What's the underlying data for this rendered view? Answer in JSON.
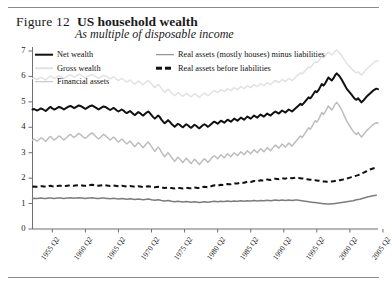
{
  "figure": {
    "label": "Figure 12",
    "title": "US household wealth",
    "subtitle": "As multiple of disposable income"
  },
  "chart_data": {
    "type": "line",
    "title": "US household wealth",
    "subtitle": "As multiple of disposable income",
    "xlabel": "",
    "ylabel": "",
    "ylim": [
      0,
      7
    ],
    "yticks": [
      0,
      1,
      2,
      3,
      4,
      5,
      6,
      7
    ],
    "grid": false,
    "legend_position": "top-inside",
    "xtick_labels": [
      "1955 Q2",
      "1960 Q2",
      "1965 Q2",
      "1970 Q2",
      "1975 Q2",
      "1980 Q2",
      "1985 Q2",
      "1990 Q2",
      "1995 Q2",
      "2000 Q2",
      "2005 Q2"
    ],
    "x_start": "1952 Q2",
    "x_end": "2006 Q2",
    "x_step_quarters": 1,
    "series": [
      {
        "name": "Net wealth",
        "color": "#111111",
        "width": 2.0,
        "dash": "solid",
        "values": [
          4.7,
          4.72,
          4.68,
          4.66,
          4.7,
          4.74,
          4.72,
          4.68,
          4.64,
          4.7,
          4.76,
          4.8,
          4.74,
          4.7,
          4.72,
          4.76,
          4.8,
          4.78,
          4.74,
          4.7,
          4.74,
          4.78,
          4.82,
          4.84,
          4.8,
          4.76,
          4.78,
          4.82,
          4.86,
          4.84,
          4.8,
          4.76,
          4.72,
          4.76,
          4.8,
          4.84,
          4.86,
          4.82,
          4.78,
          4.74,
          4.7,
          4.74,
          4.78,
          4.82,
          4.8,
          4.76,
          4.72,
          4.68,
          4.72,
          4.76,
          4.72,
          4.66,
          4.62,
          4.66,
          4.7,
          4.66,
          4.6,
          4.56,
          4.6,
          4.64,
          4.58,
          4.52,
          4.48,
          4.54,
          4.6,
          4.56,
          4.5,
          4.46,
          4.52,
          4.58,
          4.62,
          4.56,
          4.48,
          4.4,
          4.34,
          4.4,
          4.46,
          4.4,
          4.3,
          4.22,
          4.16,
          4.22,
          4.28,
          4.22,
          4.14,
          4.08,
          4.02,
          4.08,
          4.14,
          4.1,
          4.04,
          4.0,
          4.06,
          4.12,
          4.08,
          4.02,
          3.98,
          4.04,
          4.1,
          4.06,
          4.0,
          3.96,
          4.02,
          4.08,
          4.12,
          4.08,
          4.02,
          4.06,
          4.12,
          4.18,
          4.22,
          4.18,
          4.14,
          4.2,
          4.26,
          4.22,
          4.18,
          4.24,
          4.3,
          4.26,
          4.22,
          4.28,
          4.34,
          4.3,
          4.26,
          4.32,
          4.38,
          4.34,
          4.3,
          4.36,
          4.42,
          4.38,
          4.34,
          4.4,
          4.46,
          4.42,
          4.38,
          4.44,
          4.5,
          4.46,
          4.42,
          4.48,
          4.54,
          4.5,
          4.46,
          4.52,
          4.58,
          4.62,
          4.58,
          4.54,
          4.6,
          4.66,
          4.62,
          4.58,
          4.64,
          4.7,
          4.66,
          4.62,
          4.68,
          4.74,
          4.8,
          4.86,
          4.92,
          4.88,
          4.94,
          5.02,
          5.1,
          5.18,
          5.14,
          5.22,
          5.32,
          5.42,
          5.38,
          5.46,
          5.58,
          5.7,
          5.64,
          5.72,
          5.84,
          5.96,
          5.9,
          5.84,
          5.92,
          6.04,
          6.12,
          6.06,
          5.98,
          5.88,
          5.76,
          5.64,
          5.52,
          5.44,
          5.36,
          5.28,
          5.2,
          5.12,
          5.08,
          5.14,
          5.06,
          4.98,
          5.04,
          5.12,
          5.2,
          5.26,
          5.32,
          5.38,
          5.44,
          5.48,
          5.52,
          5.5
        ]
      },
      {
        "name": "Gross wealth",
        "color": "#e2e2e2",
        "width": 1.5,
        "dash": "solid",
        "values": [
          5.92,
          5.94,
          5.9,
          5.88,
          5.92,
          5.96,
          5.94,
          5.9,
          5.86,
          5.92,
          5.98,
          6.02,
          5.96,
          5.92,
          5.94,
          5.98,
          6.02,
          6.0,
          5.96,
          5.92,
          5.96,
          6.0,
          6.04,
          6.06,
          6.02,
          5.98,
          6.0,
          6.04,
          6.08,
          6.06,
          6.02,
          5.98,
          5.94,
          5.98,
          6.02,
          6.06,
          6.08,
          6.04,
          6.0,
          5.96,
          5.92,
          5.96,
          6.0,
          6.04,
          6.02,
          5.98,
          5.94,
          5.9,
          5.94,
          5.98,
          5.94,
          5.88,
          5.84,
          5.88,
          5.92,
          5.88,
          5.82,
          5.78,
          5.82,
          5.86,
          5.8,
          5.74,
          5.7,
          5.76,
          5.82,
          5.78,
          5.72,
          5.68,
          5.74,
          5.8,
          5.84,
          5.78,
          5.7,
          5.62,
          5.56,
          5.62,
          5.68,
          5.62,
          5.52,
          5.44,
          5.38,
          5.44,
          5.5,
          5.44,
          5.36,
          5.3,
          5.24,
          5.3,
          5.36,
          5.32,
          5.26,
          5.22,
          5.28,
          5.34,
          5.3,
          5.24,
          5.2,
          5.26,
          5.32,
          5.28,
          5.22,
          5.18,
          5.24,
          5.3,
          5.34,
          5.3,
          5.24,
          5.28,
          5.34,
          5.4,
          5.44,
          5.4,
          5.36,
          5.42,
          5.48,
          5.44,
          5.4,
          5.46,
          5.52,
          5.48,
          5.44,
          5.5,
          5.56,
          5.52,
          5.48,
          5.54,
          5.6,
          5.56,
          5.52,
          5.58,
          5.64,
          5.6,
          5.56,
          5.62,
          5.68,
          5.64,
          5.6,
          5.66,
          5.72,
          5.68,
          5.64,
          5.7,
          5.76,
          5.72,
          5.68,
          5.74,
          5.8,
          5.84,
          5.8,
          5.76,
          5.82,
          5.88,
          5.84,
          5.8,
          5.86,
          5.92,
          5.88,
          5.84,
          5.9,
          5.96,
          6.02,
          6.08,
          6.14,
          6.1,
          6.16,
          6.22,
          6.3,
          6.38,
          6.34,
          6.42,
          6.5,
          6.58,
          6.54,
          6.6,
          6.7,
          6.8,
          6.74,
          6.8,
          6.88,
          6.96,
          6.9,
          6.84,
          6.9,
          6.98,
          7.04,
          6.98,
          6.9,
          6.82,
          6.72,
          6.62,
          6.52,
          6.44,
          6.38,
          6.3,
          6.24,
          6.18,
          6.14,
          6.18,
          6.12,
          6.06,
          6.12,
          6.2,
          6.28,
          6.34,
          6.4,
          6.46,
          6.52,
          6.58,
          6.62,
          6.6
        ]
      },
      {
        "name": "Financial assets",
        "color": "#bdbdbd",
        "width": 1.5,
        "dash": "solid",
        "values": [
          3.5,
          3.54,
          3.48,
          3.46,
          3.52,
          3.58,
          3.56,
          3.5,
          3.44,
          3.52,
          3.6,
          3.64,
          3.56,
          3.5,
          3.54,
          3.6,
          3.66,
          3.62,
          3.56,
          3.5,
          3.56,
          3.62,
          3.68,
          3.72,
          3.66,
          3.6,
          3.64,
          3.7,
          3.76,
          3.72,
          3.66,
          3.6,
          3.56,
          3.62,
          3.68,
          3.74,
          3.78,
          3.72,
          3.66,
          3.6,
          3.54,
          3.6,
          3.66,
          3.72,
          3.68,
          3.62,
          3.56,
          3.5,
          3.56,
          3.62,
          3.56,
          3.48,
          3.42,
          3.48,
          3.54,
          3.48,
          3.4,
          3.34,
          3.4,
          3.46,
          3.38,
          3.3,
          3.24,
          3.32,
          3.4,
          3.34,
          3.26,
          3.2,
          3.28,
          3.36,
          3.42,
          3.34,
          3.24,
          3.14,
          3.06,
          3.14,
          3.22,
          3.14,
          3.02,
          2.92,
          2.84,
          2.92,
          3.0,
          2.92,
          2.82,
          2.74,
          2.66,
          2.74,
          2.82,
          2.76,
          2.68,
          2.62,
          2.7,
          2.78,
          2.72,
          2.64,
          2.58,
          2.66,
          2.74,
          2.68,
          2.6,
          2.54,
          2.62,
          2.7,
          2.76,
          2.7,
          2.62,
          2.68,
          2.76,
          2.84,
          2.88,
          2.82,
          2.76,
          2.84,
          2.92,
          2.86,
          2.8,
          2.88,
          2.96,
          2.9,
          2.84,
          2.92,
          3.0,
          2.94,
          2.88,
          2.96,
          3.04,
          2.98,
          2.92,
          3.0,
          3.08,
          3.02,
          2.96,
          3.04,
          3.12,
          3.06,
          3.0,
          3.08,
          3.16,
          3.1,
          3.04,
          3.12,
          3.2,
          3.14,
          3.08,
          3.16,
          3.24,
          3.3,
          3.24,
          3.18,
          3.26,
          3.34,
          3.28,
          3.22,
          3.3,
          3.38,
          3.32,
          3.26,
          3.34,
          3.42,
          3.5,
          3.58,
          3.66,
          3.6,
          3.68,
          3.78,
          3.88,
          3.98,
          3.92,
          4.02,
          4.14,
          4.26,
          4.2,
          4.3,
          4.44,
          4.58,
          4.5,
          4.6,
          4.72,
          4.84,
          4.76,
          4.68,
          4.78,
          4.9,
          4.98,
          4.9,
          4.8,
          4.68,
          4.54,
          4.4,
          4.26,
          4.14,
          4.04,
          3.94,
          3.84,
          3.76,
          3.72,
          3.8,
          3.7,
          3.62,
          3.7,
          3.78,
          3.86,
          3.92,
          3.98,
          4.04,
          4.1,
          4.14,
          4.18,
          4.16
        ]
      },
      {
        "name": "Real assets (mostly houses) minus liabilities",
        "color": "#7d7d7d",
        "width": 1.5,
        "dash": "solid",
        "values": [
          1.2,
          1.21,
          1.2,
          1.2,
          1.21,
          1.22,
          1.21,
          1.2,
          1.2,
          1.21,
          1.22,
          1.22,
          1.21,
          1.2,
          1.21,
          1.22,
          1.22,
          1.22,
          1.21,
          1.2,
          1.21,
          1.22,
          1.22,
          1.23,
          1.22,
          1.21,
          1.22,
          1.22,
          1.23,
          1.22,
          1.22,
          1.21,
          1.2,
          1.21,
          1.22,
          1.22,
          1.23,
          1.22,
          1.21,
          1.2,
          1.2,
          1.21,
          1.22,
          1.22,
          1.21,
          1.2,
          1.2,
          1.19,
          1.2,
          1.21,
          1.2,
          1.19,
          1.18,
          1.19,
          1.2,
          1.19,
          1.18,
          1.17,
          1.18,
          1.19,
          1.18,
          1.17,
          1.16,
          1.17,
          1.18,
          1.17,
          1.16,
          1.15,
          1.16,
          1.17,
          1.18,
          1.17,
          1.15,
          1.14,
          1.13,
          1.14,
          1.15,
          1.14,
          1.12,
          1.11,
          1.1,
          1.11,
          1.12,
          1.11,
          1.09,
          1.08,
          1.07,
          1.08,
          1.09,
          1.08,
          1.07,
          1.06,
          1.07,
          1.08,
          1.07,
          1.06,
          1.05,
          1.06,
          1.07,
          1.06,
          1.05,
          1.04,
          1.05,
          1.06,
          1.07,
          1.06,
          1.05,
          1.06,
          1.07,
          1.08,
          1.09,
          1.08,
          1.07,
          1.08,
          1.09,
          1.08,
          1.08,
          1.09,
          1.1,
          1.09,
          1.08,
          1.09,
          1.1,
          1.09,
          1.09,
          1.1,
          1.11,
          1.1,
          1.09,
          1.1,
          1.11,
          1.1,
          1.1,
          1.11,
          1.12,
          1.11,
          1.1,
          1.11,
          1.12,
          1.11,
          1.11,
          1.12,
          1.13,
          1.12,
          1.11,
          1.12,
          1.13,
          1.14,
          1.13,
          1.12,
          1.13,
          1.14,
          1.13,
          1.12,
          1.13,
          1.14,
          1.13,
          1.12,
          1.13,
          1.14,
          1.14,
          1.13,
          1.12,
          1.11,
          1.1,
          1.09,
          1.08,
          1.07,
          1.06,
          1.05,
          1.04,
          1.04,
          1.03,
          1.02,
          1.01,
          1.0,
          0.99,
          0.99,
          0.98,
          0.98,
          0.98,
          0.99,
          0.99,
          1.0,
          1.01,
          1.02,
          1.03,
          1.04,
          1.05,
          1.06,
          1.07,
          1.08,
          1.09,
          1.1,
          1.11,
          1.13,
          1.15,
          1.16,
          1.17,
          1.19,
          1.21,
          1.23,
          1.25,
          1.27,
          1.28,
          1.3,
          1.31,
          1.32,
          1.33
        ]
      },
      {
        "name": "Real assets before liabilities",
        "color": "#111111",
        "width": 2.0,
        "dash": "dashed",
        "values": [
          1.66,
          1.67,
          1.66,
          1.66,
          1.67,
          1.68,
          1.68,
          1.67,
          1.66,
          1.67,
          1.69,
          1.7,
          1.68,
          1.67,
          1.68,
          1.69,
          1.7,
          1.7,
          1.69,
          1.68,
          1.69,
          1.7,
          1.71,
          1.72,
          1.71,
          1.7,
          1.71,
          1.72,
          1.73,
          1.72,
          1.71,
          1.7,
          1.7,
          1.71,
          1.72,
          1.73,
          1.74,
          1.73,
          1.72,
          1.71,
          1.7,
          1.71,
          1.72,
          1.73,
          1.72,
          1.71,
          1.7,
          1.69,
          1.7,
          1.71,
          1.7,
          1.69,
          1.68,
          1.69,
          1.7,
          1.69,
          1.68,
          1.67,
          1.68,
          1.69,
          1.68,
          1.67,
          1.66,
          1.67,
          1.68,
          1.67,
          1.66,
          1.65,
          1.66,
          1.67,
          1.68,
          1.67,
          1.66,
          1.65,
          1.64,
          1.65,
          1.66,
          1.65,
          1.63,
          1.62,
          1.61,
          1.62,
          1.63,
          1.62,
          1.61,
          1.6,
          1.59,
          1.6,
          1.61,
          1.61,
          1.6,
          1.59,
          1.6,
          1.62,
          1.61,
          1.6,
          1.6,
          1.61,
          1.63,
          1.62,
          1.61,
          1.61,
          1.63,
          1.65,
          1.66,
          1.65,
          1.64,
          1.66,
          1.68,
          1.7,
          1.72,
          1.71,
          1.7,
          1.72,
          1.74,
          1.73,
          1.73,
          1.75,
          1.77,
          1.76,
          1.76,
          1.78,
          1.8,
          1.79,
          1.79,
          1.81,
          1.83,
          1.82,
          1.82,
          1.84,
          1.86,
          1.85,
          1.85,
          1.87,
          1.89,
          1.88,
          1.88,
          1.9,
          1.92,
          1.91,
          1.91,
          1.93,
          1.95,
          1.94,
          1.93,
          1.95,
          1.97,
          1.98,
          1.97,
          1.96,
          1.98,
          2.0,
          1.99,
          1.98,
          2.0,
          2.02,
          2.01,
          2.0,
          2.01,
          2.02,
          2.02,
          2.01,
          2.0,
          1.99,
          1.98,
          1.97,
          1.96,
          1.95,
          1.94,
          1.93,
          1.92,
          1.92,
          1.91,
          1.9,
          1.89,
          1.88,
          1.87,
          1.87,
          1.86,
          1.86,
          1.86,
          1.87,
          1.88,
          1.89,
          1.9,
          1.91,
          1.92,
          1.94,
          1.95,
          1.97,
          1.98,
          2.0,
          2.02,
          2.04,
          2.06,
          2.08,
          2.1,
          2.12,
          2.15,
          2.18,
          2.21,
          2.24,
          2.27,
          2.3,
          2.33,
          2.36,
          2.38,
          2.4,
          2.42
        ]
      }
    ]
  },
  "legend": {
    "column1": [
      {
        "label": "Net wealth",
        "color": "#111111",
        "dash": "solid",
        "width": 2.6
      },
      {
        "label": "Gross wealth",
        "color": "#e2e2e2",
        "dash": "solid",
        "width": 1.6
      },
      {
        "label": "Financial assets",
        "color": "#bdbdbd",
        "dash": "solid",
        "width": 1.6
      }
    ],
    "column2": [
      {
        "label": "Real assets (mostly houses) minus liabilities",
        "color": "#7d7d7d",
        "dash": "solid",
        "width": 1.6
      },
      {
        "label": "Real assets before liabilities",
        "color": "#111111",
        "dash": "dashed",
        "width": 2.6
      }
    ]
  },
  "axes": {
    "y_labels": [
      "7",
      "6",
      "5",
      "4",
      "3",
      "2",
      "1",
      "0"
    ],
    "x_labels": [
      "1955 Q2",
      "1960 Q2",
      "1965 Q2",
      "1970 Q2",
      "1975 Q2",
      "1980 Q2",
      "1985 Q2",
      "1990 Q2",
      "1995 Q2",
      "2000 Q2",
      "2005 Q2"
    ]
  }
}
